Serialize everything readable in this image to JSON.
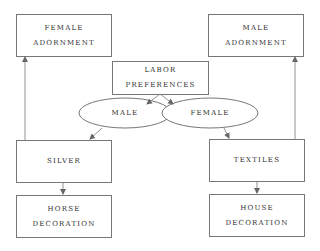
{
  "diagram": {
    "nodes": {
      "female_adornment": {
        "lines": [
          "FEMALE",
          "ADORNMENT"
        ]
      },
      "male_adornment": {
        "lines": [
          "MALE",
          "ADORNMENT"
        ]
      },
      "labor_preferences": {
        "lines": [
          "LABOR",
          "PREFERENCES"
        ]
      },
      "male": {
        "label": "MALE"
      },
      "female": {
        "label": "FEMALE"
      },
      "silver": {
        "label": "SILVER"
      },
      "textiles": {
        "label": "TEXTILES"
      },
      "horse_decoration": {
        "lines": [
          "HORSE",
          "DECORATION"
        ]
      },
      "house_decoration": {
        "lines": [
          "HOUSE",
          "DECORATION"
        ]
      }
    },
    "edges": [
      {
        "from": "labor_preferences",
        "to": "male"
      },
      {
        "from": "labor_preferences",
        "to": "female"
      },
      {
        "from": "male",
        "to": "silver"
      },
      {
        "from": "female",
        "to": "textiles"
      },
      {
        "from": "silver",
        "to": "female_adornment"
      },
      {
        "from": "textiles",
        "to": "male_adornment"
      },
      {
        "from": "silver",
        "to": "horse_decoration"
      },
      {
        "from": "textiles",
        "to": "house_decoration"
      }
    ],
    "colors": {
      "line": "#777777",
      "text": "#333333",
      "background": "#ffffff"
    }
  }
}
